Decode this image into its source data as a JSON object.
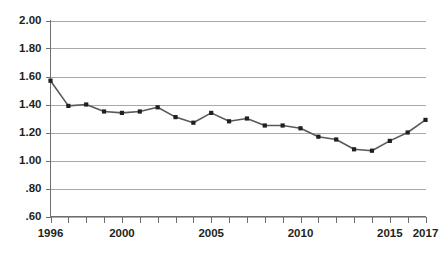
{
  "chart_data": {
    "type": "line",
    "title": "",
    "subtitle": "",
    "xlabel": "",
    "ylabel": "",
    "x": [
      1996,
      1997,
      1998,
      1999,
      2000,
      2001,
      2002,
      2003,
      2004,
      2005,
      2006,
      2007,
      2008,
      2009,
      2010,
      2011,
      2012,
      2013,
      2014,
      2015,
      2016,
      2017
    ],
    "values": [
      1.57,
      1.39,
      1.4,
      1.35,
      1.34,
      1.35,
      1.38,
      1.31,
      1.27,
      1.34,
      1.28,
      1.3,
      1.25,
      1.25,
      1.23,
      1.17,
      1.15,
      1.08,
      1.07,
      1.14,
      1.2,
      1.29
    ],
    "series": [
      {
        "name": "",
        "values": [
          1.57,
          1.39,
          1.4,
          1.35,
          1.34,
          1.35,
          1.38,
          1.31,
          1.27,
          1.34,
          1.28,
          1.3,
          1.25,
          1.25,
          1.23,
          1.17,
          1.15,
          1.08,
          1.07,
          1.14,
          1.2,
          1.29
        ]
      }
    ],
    "xlim": [
      1996,
      2017
    ],
    "ylim": [
      0.6,
      2.0
    ],
    "yticks": [
      0.6,
      0.8,
      1.0,
      1.2,
      1.4,
      1.6,
      1.8,
      2.0
    ],
    "ytick_labels": [
      ".60",
      ".80",
      "1.00",
      "1.20",
      "1.40",
      "1.60",
      "1.80",
      "2.00"
    ],
    "xticks": [
      1996,
      1997,
      1998,
      1999,
      2000,
      2001,
      2002,
      2003,
      2004,
      2005,
      2006,
      2007,
      2008,
      2009,
      2010,
      2011,
      2012,
      2013,
      2014,
      2015,
      2016,
      2017
    ],
    "xtick_labels": [
      {
        "x": 1996,
        "label": "1996"
      },
      {
        "x": 2000,
        "label": "2000"
      },
      {
        "x": 2005,
        "label": "2005"
      },
      {
        "x": 2010,
        "label": "2010"
      },
      {
        "x": 2015,
        "label": "2015"
      },
      {
        "x": 2017,
        "label": "2017"
      }
    ],
    "grid": "horizontal",
    "legend": "none",
    "annotations": [],
    "colors": {
      "line": "#58595b",
      "marker": "#231f20",
      "grid": "#a7a9ac",
      "axis": "#6d6e71",
      "text": "#231f20",
      "background": "#ffffff"
    }
  }
}
